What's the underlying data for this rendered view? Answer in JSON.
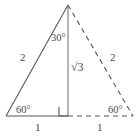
{
  "figure": {
    "stroke_color": "#565656",
    "background_color": "#ffffff",
    "labels": {
      "left_side": "2",
      "right_side": "2",
      "apex_angle": "30°",
      "altitude": "√3",
      "bottom_left_angle": "60°",
      "bottom_right_angle": "60°",
      "base_left_segment": "1",
      "base_right_segment": "1"
    },
    "geometry": {
      "apex": [
        68,
        5
      ],
      "bottom_left": [
        6,
        116
      ],
      "bottom_right": [
        133,
        116
      ],
      "foot_of_altitude": [
        68,
        116
      ],
      "right_angle_marker": {
        "x": 60,
        "y": 107,
        "size": 9
      },
      "solid_edges": [
        "apex-to-bottom-left",
        "bottom-left-to-foot",
        "altitude"
      ],
      "dashed_edges": [
        "apex-to-bottom-right",
        "foot-to-bottom-right"
      ]
    }
  }
}
